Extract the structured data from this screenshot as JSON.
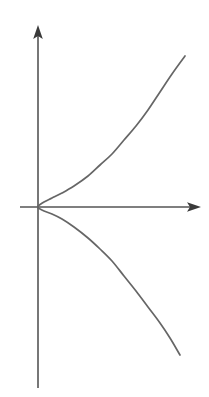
{
  "figure": {
    "background_color": "#ffffff",
    "width": 209,
    "height": 397,
    "style": "hand-drawn pencil sketch"
  },
  "axes": {
    "color": "#555555",
    "stroke_width": 1.6,
    "origin": {
      "x": 38,
      "y": 207
    },
    "x_axis": {
      "label": "",
      "start": {
        "x": 20,
        "y": 207
      },
      "end": {
        "x": 200,
        "y": 207
      },
      "arrow": "right",
      "arrow_tip": {
        "x": 201,
        "y": 207
      }
    },
    "y_axis": {
      "label": "",
      "start": {
        "x": 38,
        "y": 388
      },
      "end": {
        "x": 38,
        "y": 26
      },
      "arrow": "up",
      "arrow_tip": {
        "x": 38,
        "y": 25
      }
    }
  },
  "chart_data": {
    "type": "line",
    "title": "",
    "subtitle": "",
    "xlabel": "",
    "ylabel": "",
    "grid": false,
    "legend": null,
    "equation": "y^2 = a x",
    "vertex": {
      "x": 0,
      "y": 0
    },
    "opens": "right",
    "xlim": [
      -0.15,
      1.4
    ],
    "ylim": [
      -1.25,
      1.25
    ],
    "series": [
      {
        "name": "upper-branch",
        "color": "#666666",
        "points_px": [
          {
            "x": 38,
            "y": 206
          },
          {
            "x": 44,
            "y": 202
          },
          {
            "x": 52,
            "y": 198
          },
          {
            "x": 62,
            "y": 193
          },
          {
            "x": 74,
            "y": 186
          },
          {
            "x": 88,
            "y": 176
          },
          {
            "x": 100,
            "y": 165
          },
          {
            "x": 112,
            "y": 154
          },
          {
            "x": 124,
            "y": 140
          },
          {
            "x": 136,
            "y": 126
          },
          {
            "x": 148,
            "y": 110
          },
          {
            "x": 160,
            "y": 92
          },
          {
            "x": 172,
            "y": 74
          },
          {
            "x": 185,
            "y": 56
          }
        ]
      },
      {
        "name": "lower-branch",
        "color": "#666666",
        "points_px": [
          {
            "x": 38,
            "y": 208
          },
          {
            "x": 44,
            "y": 211
          },
          {
            "x": 52,
            "y": 214
          },
          {
            "x": 62,
            "y": 219
          },
          {
            "x": 74,
            "y": 227
          },
          {
            "x": 88,
            "y": 238
          },
          {
            "x": 100,
            "y": 249
          },
          {
            "x": 112,
            "y": 261
          },
          {
            "x": 124,
            "y": 276
          },
          {
            "x": 136,
            "y": 291
          },
          {
            "x": 148,
            "y": 307
          },
          {
            "x": 160,
            "y": 323
          },
          {
            "x": 170,
            "y": 338
          },
          {
            "x": 180,
            "y": 355
          }
        ]
      }
    ]
  }
}
